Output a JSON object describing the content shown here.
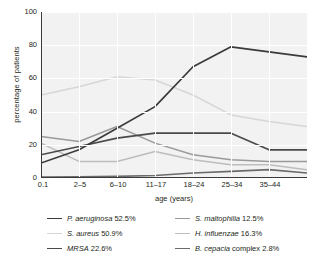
{
  "chart_data": {
    "type": "line",
    "title": "",
    "xlabel": "age (years)",
    "ylabel": "percentage of patients",
    "categories": [
      "0.1",
      "2–5",
      "6–10",
      "11–17",
      "18–24",
      "25–34",
      "35–44",
      ""
    ],
    "ylim": [
      0,
      100
    ],
    "yticks": [
      0,
      20,
      40,
      60,
      80,
      100
    ],
    "grid": true,
    "legend_position": "bottom",
    "series": [
      {
        "name": "P. aeruginosa",
        "legend_label": "P. aeruginosa 52.5%",
        "overall_percent": 52.5,
        "color": "#3a3a3a",
        "values": [
          9,
          17,
          30,
          43,
          67,
          79,
          76,
          73
        ]
      },
      {
        "name": "S. aureus",
        "legend_label": "S. aureus 50.9%",
        "overall_percent": 50.9,
        "color": "#d6d6d6",
        "values": [
          50,
          55,
          61,
          59,
          50,
          38,
          34,
          31
        ]
      },
      {
        "name": "MRSA",
        "legend_label": "MRSA 22.6%",
        "overall_percent": 22.6,
        "color": "#4a4a4a",
        "values": [
          14,
          19,
          24,
          27,
          27,
          27,
          17,
          17
        ]
      },
      {
        "name": "S. maltophilia",
        "legend_label": "S. maltophilia 12.5%",
        "overall_percent": 12.5,
        "color": "#9a9a9a",
        "values": [
          25,
          22,
          31,
          21,
          14,
          11,
          10,
          10
        ]
      },
      {
        "name": "H. influenzae",
        "legend_label": "H. influenzae 16.3%",
        "overall_percent": 16.3,
        "color": "#bdbdbd",
        "values": [
          21,
          10,
          10,
          16,
          11,
          8,
          8,
          5
        ]
      },
      {
        "name": "B. cepacia complex",
        "legend_label": "B. cepacia complex 2.8%",
        "overall_percent": 2.8,
        "color": "#6b6b6b",
        "values": [
          0.5,
          0.7,
          1,
          1.5,
          3,
          4,
          5,
          3
        ]
      }
    ]
  },
  "axes": {
    "y_ticks": [
      "100",
      "80",
      "60",
      "40",
      "20",
      "0"
    ],
    "x_ticks": [
      "0.1",
      "2–5",
      "6–10",
      "11–17",
      "18–24",
      "25–34",
      "35–44"
    ],
    "x_title": "age (years)",
    "y_title": "percentage of patients"
  },
  "legend": {
    "left": [
      {
        "label_italic": "P. aeruginosa",
        "label_rest": " 52.5%"
      },
      {
        "label_italic": "S. aureus",
        "label_rest": " 50.9%"
      },
      {
        "label_italic": "MRSA",
        "label_rest": " 22.6%"
      }
    ],
    "right": [
      {
        "label_italic": "S. maltophilia",
        "label_rest": " 12.5%"
      },
      {
        "label_italic": "H. influenzae",
        "label_rest": " 16.3%"
      },
      {
        "label_italic": "B. cepacia",
        "label_rest": " complex 2.8%"
      }
    ]
  }
}
